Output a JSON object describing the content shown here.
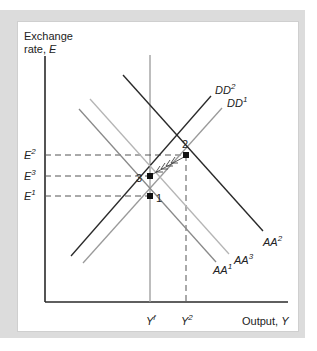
{
  "axes": {
    "y_label_line1": "Exchange",
    "y_label_line2": "rate, ",
    "y_label_var": "E",
    "x_label": "Output, ",
    "x_label_var": "Y"
  },
  "levels": {
    "E2": {
      "base": "E",
      "sup": "2"
    },
    "E3": {
      "base": "E",
      "sup": "3"
    },
    "E1": {
      "base": "E",
      "sup": "1"
    },
    "Yf": {
      "base": "Y",
      "sup": "f"
    },
    "Y2": {
      "base": "Y",
      "sup": "2"
    }
  },
  "curves": {
    "DD2": {
      "base": "DD",
      "sup": "2"
    },
    "DD1": {
      "base": "DD",
      "sup": "1"
    },
    "AA1": {
      "base": "AA",
      "sup": "1"
    },
    "AA2": {
      "base": "AA",
      "sup": "2"
    },
    "AA3": {
      "base": "AA",
      "sup": "3"
    }
  },
  "points": {
    "p1": "1",
    "p2": "2",
    "p3": "3"
  },
  "colors": {
    "dark_line": "#2a2a2a",
    "gray_line": "#9a9a9a",
    "frame": "#dcdcdc"
  }
}
